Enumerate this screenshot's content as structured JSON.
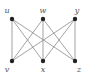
{
  "graph": {
    "type": "bipartite",
    "name": "K3,3",
    "colors": {
      "edge": "#8a8a8a",
      "node": "#222222",
      "label": "#555555",
      "background": "#ffffff"
    },
    "nodes": [
      {
        "id": "u",
        "label": "u",
        "x": 12,
        "y": 19,
        "lx": 7,
        "ly": 13
      },
      {
        "id": "w",
        "label": "w",
        "x": 43,
        "y": 19,
        "lx": 43,
        "ly": 13
      },
      {
        "id": "y",
        "label": "y",
        "x": 75,
        "y": 19,
        "lx": 77,
        "ly": 13
      },
      {
        "id": "v",
        "label": "v",
        "x": 12,
        "y": 61,
        "lx": 7,
        "ly": 72
      },
      {
        "id": "x",
        "label": "x",
        "x": 43,
        "y": 61,
        "lx": 43,
        "ly": 72
      },
      {
        "id": "z",
        "label": "z",
        "x": 75,
        "y": 61,
        "lx": 79,
        "ly": 72
      }
    ],
    "edges": [
      [
        "u",
        "v"
      ],
      [
        "u",
        "x"
      ],
      [
        "u",
        "z"
      ],
      [
        "w",
        "v"
      ],
      [
        "w",
        "x"
      ],
      [
        "w",
        "z"
      ],
      [
        "y",
        "v"
      ],
      [
        "y",
        "x"
      ],
      [
        "y",
        "z"
      ]
    ]
  }
}
